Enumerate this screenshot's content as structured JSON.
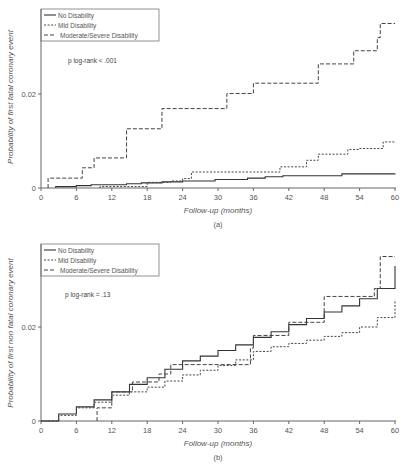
{
  "chart_data": [
    {
      "panel": "a",
      "caption": "(a)",
      "type": "line",
      "step": true,
      "title": "",
      "xlabel": "Follow-up (months)",
      "ylabel": "Probability of first fatal coronary event",
      "xlim": [
        0,
        60
      ],
      "ylim": [
        0,
        0.036
      ],
      "xticks": [
        0,
        6,
        12,
        18,
        24,
        30,
        36,
        42,
        48,
        54,
        60
      ],
      "yticks": [
        0,
        0.02
      ],
      "ytick_labels": [
        "0",
        "0.02"
      ],
      "annotation": "p log-rank < .001",
      "legend": [
        "No Disability",
        "Mid Disability",
        "Moderate/Severe Disability"
      ],
      "legend_position": "upper left",
      "series": [
        {
          "name": "No Disability",
          "style": "solid",
          "x": [
            2.5,
            6,
            8.5,
            14.5,
            17,
            20.5,
            24,
            29.5,
            35,
            38,
            41,
            51,
            60
          ],
          "y": [
            0.0003,
            0.0005,
            0.0007,
            0.0009,
            0.0011,
            0.0013,
            0.0015,
            0.0018,
            0.0021,
            0.0024,
            0.0026,
            0.003,
            0.0031
          ]
        },
        {
          "name": "Mid Disability",
          "style": "dotted",
          "x": [
            10,
            18,
            22,
            24,
            25.5,
            34,
            40.5,
            45,
            47,
            52,
            54,
            58,
            60
          ],
          "y": [
            0.0003,
            0.0012,
            0.0015,
            0.002,
            0.0034,
            0.0034,
            0.0045,
            0.0059,
            0.0072,
            0.0082,
            0.0084,
            0.0098,
            0.0099
          ]
        },
        {
          "name": "Moderate/Severe Disability",
          "style": "dashed",
          "x": [
            1.2,
            7,
            9,
            14.5,
            20.5,
            31.5,
            36,
            40.5,
            47,
            51,
            53,
            57,
            57.5,
            60
          ],
          "y": [
            0.0021,
            0.0043,
            0.0064,
            0.0126,
            0.0169,
            0.0201,
            0.0223,
            0.0223,
            0.0264,
            0.0264,
            0.0292,
            0.032,
            0.035,
            0.035
          ]
        }
      ]
    },
    {
      "panel": "b",
      "caption": "(b)",
      "type": "line",
      "step": true,
      "title": "",
      "xlabel": "Follow-up (months)",
      "ylabel": "Probability of first non fatal coronary event",
      "xlim": [
        0,
        60
      ],
      "ylim": [
        0,
        0.036
      ],
      "xticks": [
        0,
        6,
        12,
        18,
        24,
        30,
        36,
        42,
        48,
        54,
        60
      ],
      "yticks": [
        0,
        0.02
      ],
      "ytick_labels": [
        "0",
        "0.02"
      ],
      "annotation": "p log-rank = .13",
      "legend": [
        "No Disability",
        "Mid Disability",
        "Moderate/Severe Disability"
      ],
      "legend_position": "upper left",
      "series": [
        {
          "name": "No Disability",
          "style": "solid",
          "x": [
            0,
            3,
            6,
            9,
            12,
            15,
            18,
            21,
            24,
            27,
            30,
            33,
            36,
            39,
            42,
            45,
            48,
            51,
            54,
            57,
            60
          ],
          "y": [
            0,
            0.0015,
            0.003,
            0.0045,
            0.0062,
            0.0078,
            0.0092,
            0.011,
            0.0128,
            0.0138,
            0.015,
            0.0162,
            0.0178,
            0.019,
            0.0205,
            0.0218,
            0.0232,
            0.0245,
            0.026,
            0.0282,
            0.033
          ]
        },
        {
          "name": "Mid Disability",
          "style": "dotted",
          "x": [
            0,
            3,
            6,
            9,
            12,
            15,
            18,
            21,
            24,
            27,
            30,
            33,
            36,
            39,
            42,
            45,
            48,
            51,
            54,
            57,
            60
          ],
          "y": [
            0,
            0.0012,
            0.0028,
            0.004,
            0.0055,
            0.0062,
            0.0072,
            0.0085,
            0.0098,
            0.0108,
            0.0118,
            0.013,
            0.0148,
            0.0158,
            0.0165,
            0.0172,
            0.018,
            0.0188,
            0.02,
            0.022,
            0.0258
          ]
        },
        {
          "name": "Moderate/Severe Disability",
          "style": "dashed",
          "x": [
            9.5,
            12,
            15.5,
            20,
            22,
            31,
            35.5,
            36,
            42,
            48,
            54.5,
            56.5,
            57.5,
            60
          ],
          "y": [
            0.0028,
            0.0062,
            0.0083,
            0.01,
            0.012,
            0.012,
            0.0155,
            0.0182,
            0.021,
            0.0265,
            0.0265,
            0.0282,
            0.035,
            0.035
          ]
        }
      ]
    }
  ]
}
